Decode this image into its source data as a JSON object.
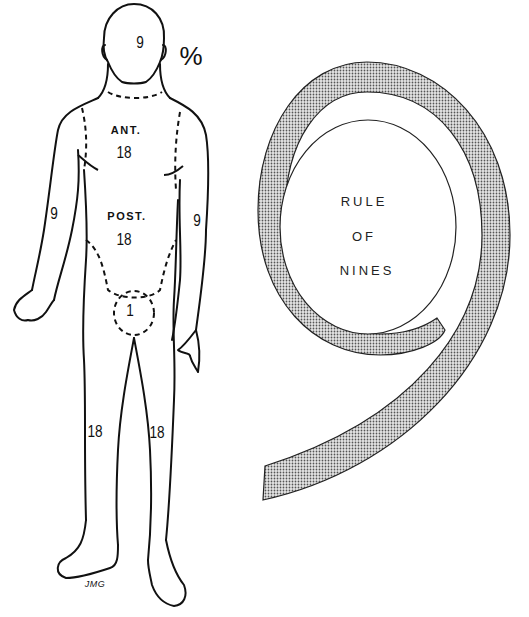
{
  "title": {
    "lines": [
      "RULE",
      "OF",
      "NINES"
    ]
  },
  "unit_symbol": "%",
  "regions": {
    "head": {
      "value": "9"
    },
    "anterior_trunk": {
      "label": "ANT.",
      "value": "18"
    },
    "posterior_trunk": {
      "label": "POST.",
      "value": "18"
    },
    "right_arm": {
      "value": "9"
    },
    "left_arm": {
      "value": "9"
    },
    "perineum": {
      "value": "1"
    },
    "right_leg": {
      "value": "18"
    },
    "left_leg": {
      "value": "18"
    }
  },
  "signature": "JMG",
  "colors": {
    "line": "#111111",
    "stipple": "#8a8a8a",
    "background": "#ffffff"
  }
}
